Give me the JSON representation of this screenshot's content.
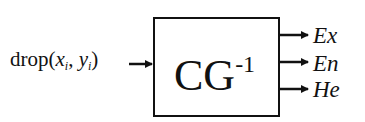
{
  "diagram": {
    "input": {
      "prefix": "drop(",
      "x": "x",
      "x_sub": "i",
      "sep": ", ",
      "y": "y",
      "y_sub": "i",
      "suffix": ")"
    },
    "block": {
      "main": "CG",
      "sup": "-1"
    },
    "outputs": [
      {
        "label": "Ex"
      },
      {
        "label": "En"
      },
      {
        "label": "He"
      }
    ]
  }
}
